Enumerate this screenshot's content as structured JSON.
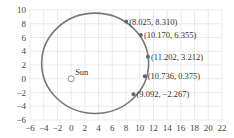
{
  "chart_data": {
    "type": "scatter",
    "title": "",
    "xlabel": "",
    "ylabel": "",
    "xlim": [
      -6,
      22
    ],
    "ylim": [
      -6,
      10
    ],
    "grid": true,
    "x_ticks": [
      -6,
      -4,
      -2,
      0,
      2,
      4,
      6,
      8,
      10,
      12,
      14,
      16,
      18,
      20,
      22
    ],
    "y_ticks": [
      -6,
      -4,
      -2,
      0,
      2,
      4,
      6,
      8,
      10
    ],
    "orbit": {
      "shape": "ellipse",
      "center": [
        3.5,
        2.25
      ],
      "rx": 7.8,
      "ry": 7.3,
      "color": "#777777"
    },
    "sun": {
      "label": "Sun",
      "x": 0,
      "y": 0
    },
    "points": [
      {
        "x": 8.025,
        "y": 8.31,
        "label": "(8.025, 8.310)"
      },
      {
        "x": 10.17,
        "y": 6.355,
        "label": "(10.170, 6.355)"
      },
      {
        "x": 11.202,
        "y": 3.212,
        "label": "(11.202, 3.212)"
      },
      {
        "x": 10.736,
        "y": 0.375,
        "label": "(10.736, 0.375)"
      },
      {
        "x": 9.092,
        "y": -2.267,
        "label": "(9.092, −2.267)"
      }
    ],
    "point_color": "#666666",
    "grid_color": "#dddddd"
  }
}
